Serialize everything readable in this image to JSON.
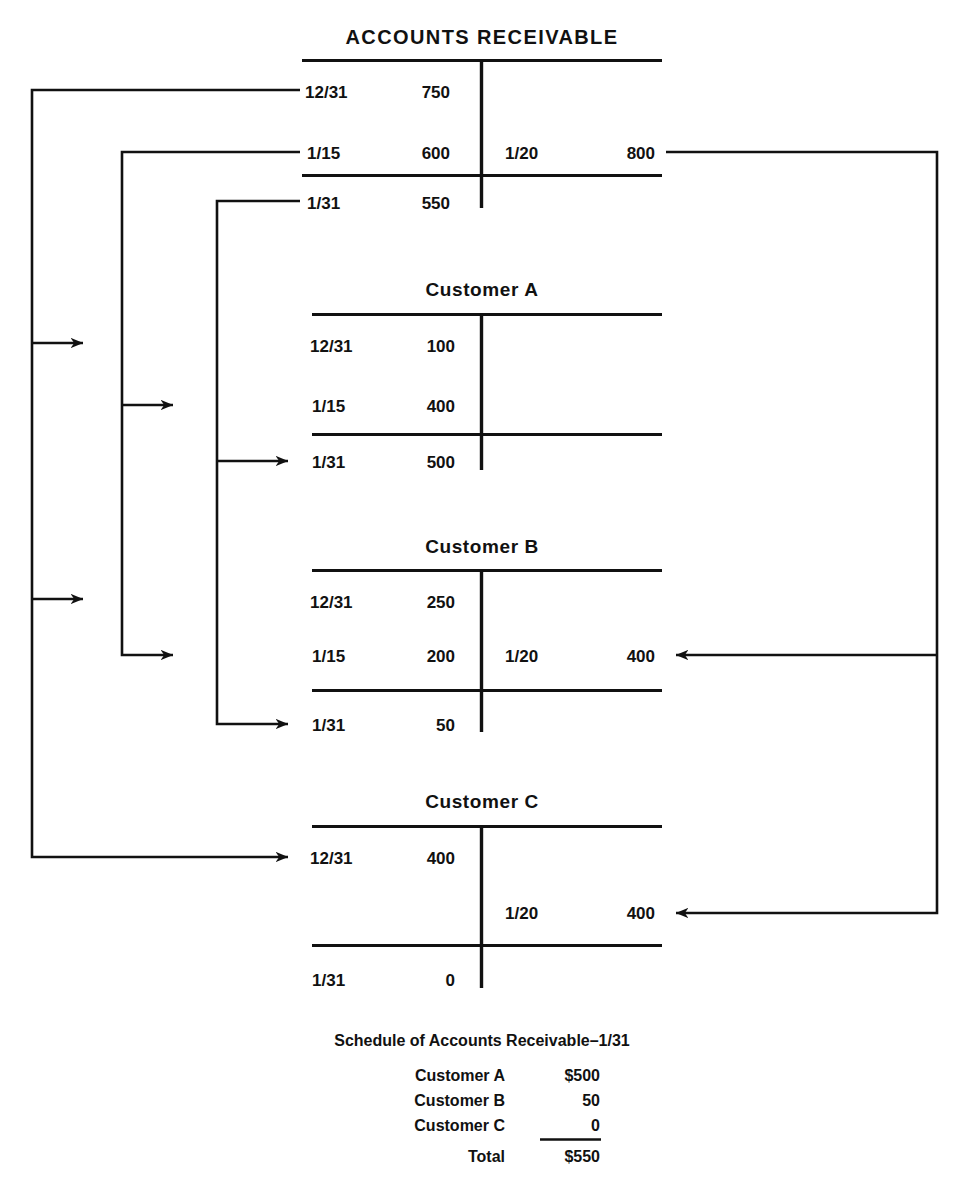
{
  "page": {
    "width": 970,
    "height": 1191,
    "background": "#ffffff",
    "ink_color": "#111111"
  },
  "accounts": [
    {
      "id": "accounts-receivable",
      "title": "ACCOUNTS RECEIVABLE",
      "debits": [
        {
          "date": "12/31",
          "amount": "750"
        },
        {
          "date": "1/15",
          "amount": "600"
        },
        {
          "date": "1/31",
          "amount": "550"
        }
      ],
      "credits": [
        {
          "date": "1/20",
          "amount": "800"
        }
      ]
    },
    {
      "id": "customer-a",
      "title": "Customer A",
      "debits": [
        {
          "date": "12/31",
          "amount": "100"
        },
        {
          "date": "1/15",
          "amount": "400"
        },
        {
          "date": "1/31",
          "amount": "500"
        }
      ],
      "credits": []
    },
    {
      "id": "customer-b",
      "title": "Customer B",
      "debits": [
        {
          "date": "12/31",
          "amount": "250"
        },
        {
          "date": "1/15",
          "amount": "200"
        },
        {
          "date": "1/31",
          "amount": "50"
        }
      ],
      "credits": [
        {
          "date": "1/20",
          "amount": "400"
        }
      ]
    },
    {
      "id": "customer-c",
      "title": "Customer C",
      "debits": [
        {
          "date": "12/31",
          "amount": "400"
        },
        {
          "date": "1/31",
          "amount": "0"
        }
      ],
      "credits": [
        {
          "date": "1/20",
          "amount": "400"
        }
      ]
    }
  ],
  "schedule": {
    "title": "Schedule of Accounts Receivable–1/31",
    "rows": [
      {
        "label": "Customer A",
        "value": "$500"
      },
      {
        "label": "Customer B",
        "value": "50"
      },
      {
        "label": "Customer C",
        "value": "0"
      }
    ],
    "total": {
      "label": "Total",
      "value": "$550"
    }
  }
}
